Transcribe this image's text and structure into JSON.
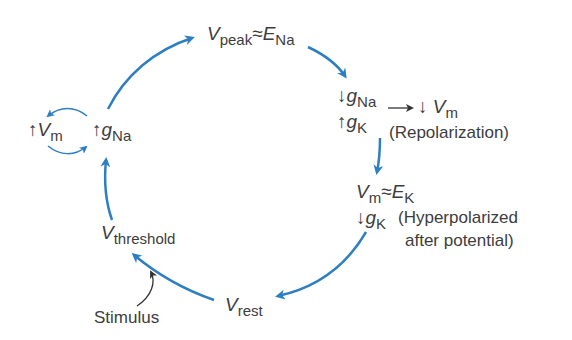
{
  "diagram": {
    "colors": {
      "cycle_arrow": "#2d7fc1",
      "text": "#3d3d3d",
      "small_arrow": "#333333"
    },
    "nodes": {
      "peak": {
        "var": "V",
        "var_sub": "peak",
        "rel": "≈",
        "ref": "E",
        "ref_sub": "Na"
      },
      "depolarize_left": {
        "arrow": "↑",
        "var": "V",
        "var_sub": "m"
      },
      "depolarize_right": {
        "arrow": "↑",
        "var": "g",
        "var_sub": "Na"
      },
      "repol_gna": {
        "arrow": "↓",
        "var": "g",
        "var_sub": "Na"
      },
      "repol_gk": {
        "arrow": "↑",
        "var": "g",
        "var_sub": "K"
      },
      "repol_result": {
        "arrow": "↓",
        "var": "V",
        "var_sub": "m",
        "note": "(Repolarization)"
      },
      "hyper": {
        "var": "V",
        "var_sub": "m",
        "rel": "≈",
        "ref": "E",
        "ref_sub": "K"
      },
      "hyper_gk": {
        "arrow": "↓",
        "var": "g",
        "var_sub": "K",
        "note_line1": "(Hyperpolarized",
        "note_line2": "after potential)"
      },
      "threshold": {
        "var": "V",
        "var_sub": "threshold"
      },
      "rest": {
        "var": "V",
        "var_sub": "rest"
      },
      "stimulus": {
        "label": "Stimulus"
      }
    }
  }
}
